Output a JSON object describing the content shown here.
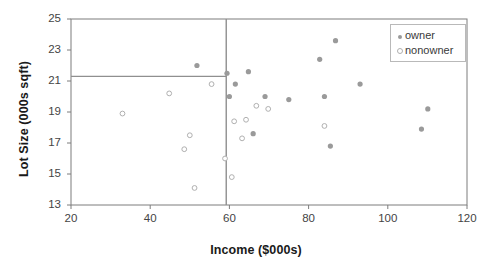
{
  "chart_data": {
    "type": "scatter",
    "title": "",
    "xlabel": "Income ($000s)",
    "ylabel": "Lot Size (000s sqft)",
    "xlim": [
      20,
      120
    ],
    "ylim": [
      13,
      25
    ],
    "xticks": [
      20,
      40,
      60,
      80,
      100,
      120
    ],
    "yticks": [
      13,
      15,
      17,
      19,
      21,
      23,
      25
    ],
    "grid": false,
    "legend_position": "top-right",
    "legend": [
      "owner",
      "nonowner"
    ],
    "colors": {
      "owner_marker": "#9a9a9a",
      "nonowner_marker": "#b0b0b0",
      "axis": "#7d7d7d",
      "split_line": "#8f8f8f",
      "text": "#1a1a1a"
    },
    "annotations": {
      "vertical_split_x": 59.2,
      "horizontal_split_y": 21.3,
      "horizontal_split_xmax": 59.2
    },
    "series": [
      {
        "name": "owner",
        "marker": "filled-circle",
        "points": [
          [
            51.8,
            22.0
          ],
          [
            59.4,
            21.5
          ],
          [
            60.0,
            20.0
          ],
          [
            61.5,
            20.8
          ],
          [
            64.8,
            21.6
          ],
          [
            66.0,
            17.6
          ],
          [
            69.0,
            20.0
          ],
          [
            75.0,
            19.8
          ],
          [
            82.8,
            22.4
          ],
          [
            84.0,
            20.0
          ],
          [
            85.5,
            16.8
          ],
          [
            86.8,
            23.6
          ],
          [
            93.0,
            20.8
          ],
          [
            108.5,
            17.9
          ],
          [
            110.1,
            19.2
          ]
        ]
      },
      {
        "name": "nonowner",
        "marker": "open-circle",
        "points": [
          [
            33.0,
            18.9
          ],
          [
            44.8,
            20.2
          ],
          [
            48.6,
            16.6
          ],
          [
            50.0,
            17.5
          ],
          [
            51.2,
            14.1
          ],
          [
            55.5,
            20.8
          ],
          [
            58.9,
            16.0
          ],
          [
            60.6,
            14.8
          ],
          [
            61.2,
            18.4
          ],
          [
            63.2,
            17.3
          ],
          [
            64.2,
            18.5
          ],
          [
            66.8,
            19.4
          ],
          [
            69.8,
            19.2
          ],
          [
            84.0,
            18.1
          ]
        ]
      }
    ]
  }
}
